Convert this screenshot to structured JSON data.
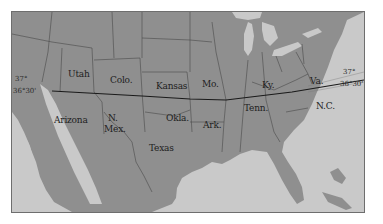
{
  "map": {
    "title": "",
    "colors": {
      "background": "#ffffff",
      "water": "#c9c9c9",
      "land": "#8f8f8f",
      "border": "#4a4a4a",
      "parallel_line": "#1a1a1a"
    },
    "states": [
      {
        "id": "utah",
        "label": "Utah"
      },
      {
        "id": "colorado",
        "label": "Colo."
      },
      {
        "id": "kansas",
        "label": "Kansas"
      },
      {
        "id": "missouri",
        "label": "Mo."
      },
      {
        "id": "kentucky",
        "label": "Ky."
      },
      {
        "id": "virginia",
        "label": "Va."
      },
      {
        "id": "arizona",
        "label": "Arizona"
      },
      {
        "id": "new-mexico-line1",
        "label": "N."
      },
      {
        "id": "new-mexico-line2",
        "label": "Mex."
      },
      {
        "id": "oklahoma",
        "label": "Okla."
      },
      {
        "id": "arkansas",
        "label": "Ark."
      },
      {
        "id": "tennessee",
        "label": "Tenn."
      },
      {
        "id": "north-carolina",
        "label": "N.C."
      },
      {
        "id": "texas",
        "label": "Texas"
      }
    ],
    "parallels": {
      "west": {
        "upper": "37°",
        "lower": "36°30'"
      },
      "east": {
        "upper": "37°",
        "lower": "36°30'"
      }
    }
  }
}
